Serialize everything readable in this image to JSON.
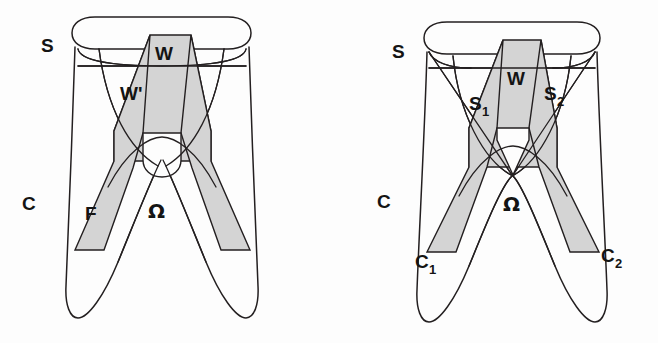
{
  "figure": {
    "background_color": "#fdfdfd",
    "line_color": "#231f20",
    "shade_color": "#d4d4d4",
    "panel_count": 2
  },
  "panels": [
    {
      "id": "left",
      "name": "left-diagram",
      "labels": {
        "s": "S",
        "c": "C",
        "w": "W",
        "w_prime": "W'",
        "f": "F",
        "omega": "Ω"
      }
    },
    {
      "id": "right",
      "name": "right-diagram",
      "labels": {
        "s": "S",
        "c": "C",
        "w": "W",
        "s1": "S",
        "s1_sub": "1",
        "s2": "S",
        "s2_sub": "2",
        "c1": "C",
        "c1_sub": "1",
        "c2": "C",
        "c2_sub": "2",
        "omega": "Ω"
      }
    }
  ]
}
